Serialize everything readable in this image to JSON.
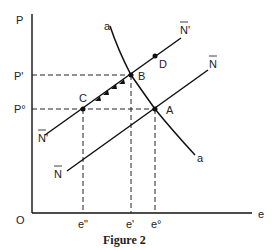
{
  "figure": {
    "caption": "Figure 2",
    "axes": {
      "origin_label": "O",
      "y_label": "P",
      "x_label": "e",
      "y_ticks": [
        "P'",
        "P°"
      ],
      "x_ticks": [
        "e\"",
        "e'",
        "e°"
      ]
    },
    "curves": {
      "a_top": "a",
      "a_bottom": "a",
      "N_prime_top": "N'",
      "N_prime_bottom": "N'",
      "N_top": "N",
      "N_bottom": "N"
    },
    "points": {
      "A": "A",
      "B": "B",
      "C": "C",
      "D": "D"
    }
  }
}
